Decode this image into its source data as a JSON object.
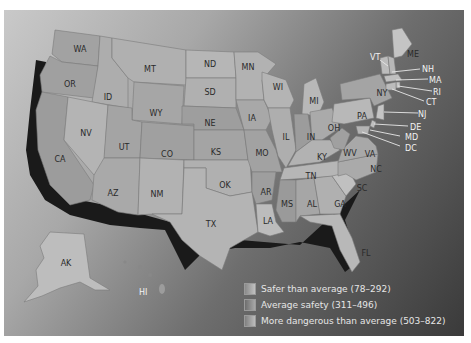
{
  "map": {
    "title": "",
    "colors": {
      "safer": "#b8b8b8",
      "average": "#9a9a9a",
      "dangerous": "#c8c8c8",
      "shadow": "#1a1a1a",
      "water_light": "#c4c4c4",
      "water_dark": "#3a3a3a"
    },
    "states": {
      "WA": "WA",
      "OR": "OR",
      "CA": "CA",
      "ID": "ID",
      "NV": "NV",
      "MT": "MT",
      "WY": "WY",
      "UT": "UT",
      "AZ": "AZ",
      "CO": "CO",
      "NM": "NM",
      "ND": "ND",
      "SD": "SD",
      "NE": "NE",
      "KS": "KS",
      "OK": "OK",
      "TX": "TX",
      "MN": "MN",
      "IA": "IA",
      "MO": "MO",
      "AR": "AR",
      "LA": "LA",
      "WI": "WI",
      "IL": "IL",
      "MI": "MI",
      "IN": "IN",
      "OH": "OH",
      "KY": "KY",
      "TN": "TN",
      "MS": "MS",
      "AL": "AL",
      "GA": "GA",
      "FL": "FL",
      "SC": "SC",
      "NC": "NC",
      "VA": "VA",
      "WV": "WV",
      "PA": "PA",
      "NY": "NY",
      "VT": "VT",
      "NH": "NH",
      "ME": "ME",
      "MA": "MA",
      "RI": "RI",
      "CT": "CT",
      "NJ": "NJ",
      "DE": "DE",
      "MD": "MD",
      "DC": "DC",
      "AK": "AK",
      "HI": "HI"
    }
  },
  "legend": {
    "items": [
      {
        "label": "Safer than average (78–292)",
        "color": "#b0b0b0"
      },
      {
        "label": "Average safety (311–496)",
        "color": "#8e8e8e"
      },
      {
        "label": "More dangerous than average (503–822)",
        "color": "#a6a6a6"
      }
    ]
  }
}
